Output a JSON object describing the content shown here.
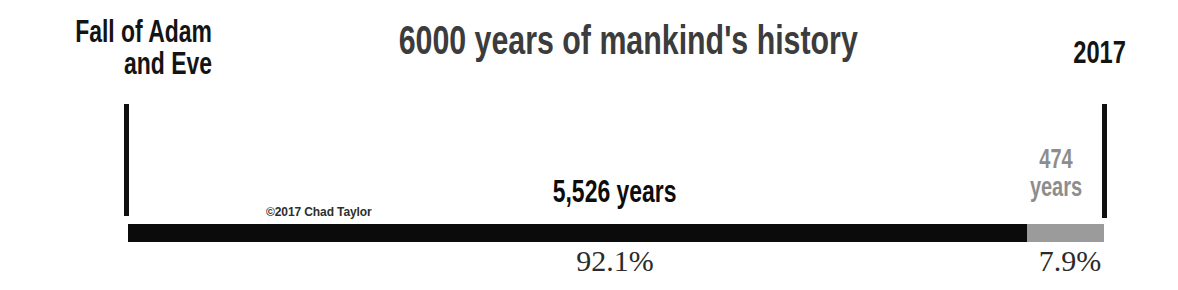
{
  "title": "6000 years of mankind's history",
  "credit": "©2017 Chad Taylor",
  "endpoints": {
    "left_line1": "Fall of Adam",
    "left_line2": "and Eve",
    "right": "2017"
  },
  "segments": {
    "one": {
      "value_label": "5,526 years",
      "percent_label": "92.1%"
    },
    "two": {
      "value_label_line1": "474",
      "value_label_line2": "years",
      "percent_label": "7.9%"
    }
  },
  "colors": {
    "segment_one": "#0b0b0b",
    "segment_two": "#9b9b9b",
    "title_text": "#3c3c3c",
    "segment_two_text": "#8d8d8d",
    "background": "#ffffff"
  },
  "chart_data": {
    "type": "bar",
    "orientation": "horizontal",
    "stacked": true,
    "title": "6000 years of mankind's history",
    "xlabel": "",
    "ylabel": "",
    "total": 6000,
    "total_unit": "years",
    "axis_endpoints": [
      "Fall of Adam and Eve",
      "2017"
    ],
    "categories": [
      "5,526 years",
      "474 years"
    ],
    "values": [
      5526,
      474
    ],
    "percentages": [
      92.1,
      7.9
    ],
    "series": [
      {
        "name": "5,526 years",
        "value": 5526,
        "percent": 92.1,
        "color": "#0b0b0b",
        "data_label": "5,526 years",
        "percent_label": "92.1%"
      },
      {
        "name": "474 years",
        "value": 474,
        "percent": 7.9,
        "color": "#9b9b9b",
        "data_label": "474 years",
        "percent_label": "7.9%"
      }
    ],
    "grid": false,
    "legend": false,
    "annotations": [
      "©2017 Chad Taylor"
    ]
  }
}
